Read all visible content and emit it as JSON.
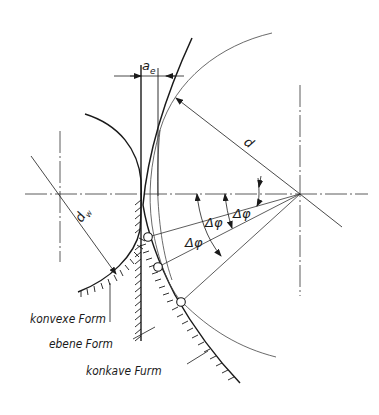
{
  "diagram": {
    "labels": {
      "a_e": "a",
      "a_e_sub": "e",
      "d": "d",
      "d_w": "d",
      "d_w_sub": "w",
      "delta_phi_1": "Δφ",
      "delta_phi_2": "Δφ",
      "delta_phi_3": "Δφ"
    },
    "legend": {
      "convex": "konvexe Form",
      "flat": "ebene Form",
      "concave": "konkave Furm"
    },
    "colors": {
      "line": "#1a1a1a",
      "thin_line": "#444444",
      "background": "#ffffff"
    }
  }
}
